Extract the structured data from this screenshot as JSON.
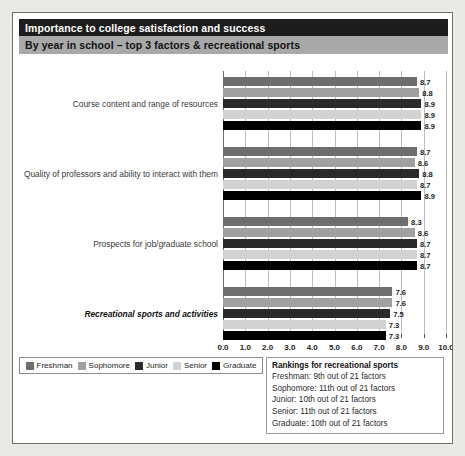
{
  "header": {
    "title": "Importance to college satisfaction and success",
    "subtitle": "By year in school – top 3 factors & recreational sports"
  },
  "legend": {
    "items": [
      {
        "label": "Freshman",
        "color": "#6e6e6e"
      },
      {
        "label": "Sophomore",
        "color": "#a0a0a0"
      },
      {
        "label": "Junior",
        "color": "#2a2a2a"
      },
      {
        "label": "Senior",
        "color": "#d2d2d2"
      },
      {
        "label": "Graduate",
        "color": "#000000"
      }
    ]
  },
  "rankings": {
    "title": "Rankings for recreational sports",
    "lines": [
      "Freshman: 9th out of 21 factors",
      "Sophomore: 11th out of 21 factors",
      "Junior: 10th out of 21 factors",
      "Senior: 11th out of 21 factors",
      "Graduate: 10th out of 21 factors"
    ]
  },
  "chart_data": {
    "type": "bar",
    "orientation": "horizontal",
    "title": "Importance to college satisfaction and success",
    "subtitle": "By year in school – top 3 factors & recreational sports",
    "xlabel": "",
    "ylabel": "",
    "xlim": [
      0.0,
      10.0
    ],
    "xticks": [
      "0.0",
      "1.0",
      "2.0",
      "3.0",
      "4.0",
      "5.0",
      "6.0",
      "7.0",
      "8.0",
      "9.0",
      "10.0"
    ],
    "grid": true,
    "legend_position": "bottom-left",
    "categories": [
      "Course content and range of resources",
      "Quality of professors and ability to interact with them",
      "Prospects for job/graduate school",
      "Recreational sports and activities"
    ],
    "highlight_category": "Recreational sports and activities",
    "series": [
      {
        "name": "Freshman",
        "color": "#6e6e6e",
        "values": [
          8.7,
          8.7,
          8.3,
          7.6
        ]
      },
      {
        "name": "Sophomore",
        "color": "#a0a0a0",
        "values": [
          8.8,
          8.6,
          8.6,
          7.6
        ]
      },
      {
        "name": "Junior",
        "color": "#2a2a2a",
        "values": [
          8.9,
          8.8,
          8.7,
          7.5
        ]
      },
      {
        "name": "Senior",
        "color": "#d2d2d2",
        "values": [
          8.9,
          8.7,
          8.7,
          7.3
        ]
      },
      {
        "name": "Graduate",
        "color": "#000000",
        "values": [
          8.9,
          8.9,
          8.7,
          7.3
        ]
      }
    ],
    "value_labels": [
      [
        "8.7",
        "8.8",
        "8.9",
        "8.9",
        "8.9"
      ],
      [
        "8.7",
        "8.6",
        "8.8",
        "8.7",
        "8.9"
      ],
      [
        "8.3",
        "8.6",
        "8.7",
        "8.7",
        "8.7"
      ],
      [
        "7.6",
        "7.6",
        "7.5",
        "7.3",
        "7.3"
      ]
    ]
  }
}
